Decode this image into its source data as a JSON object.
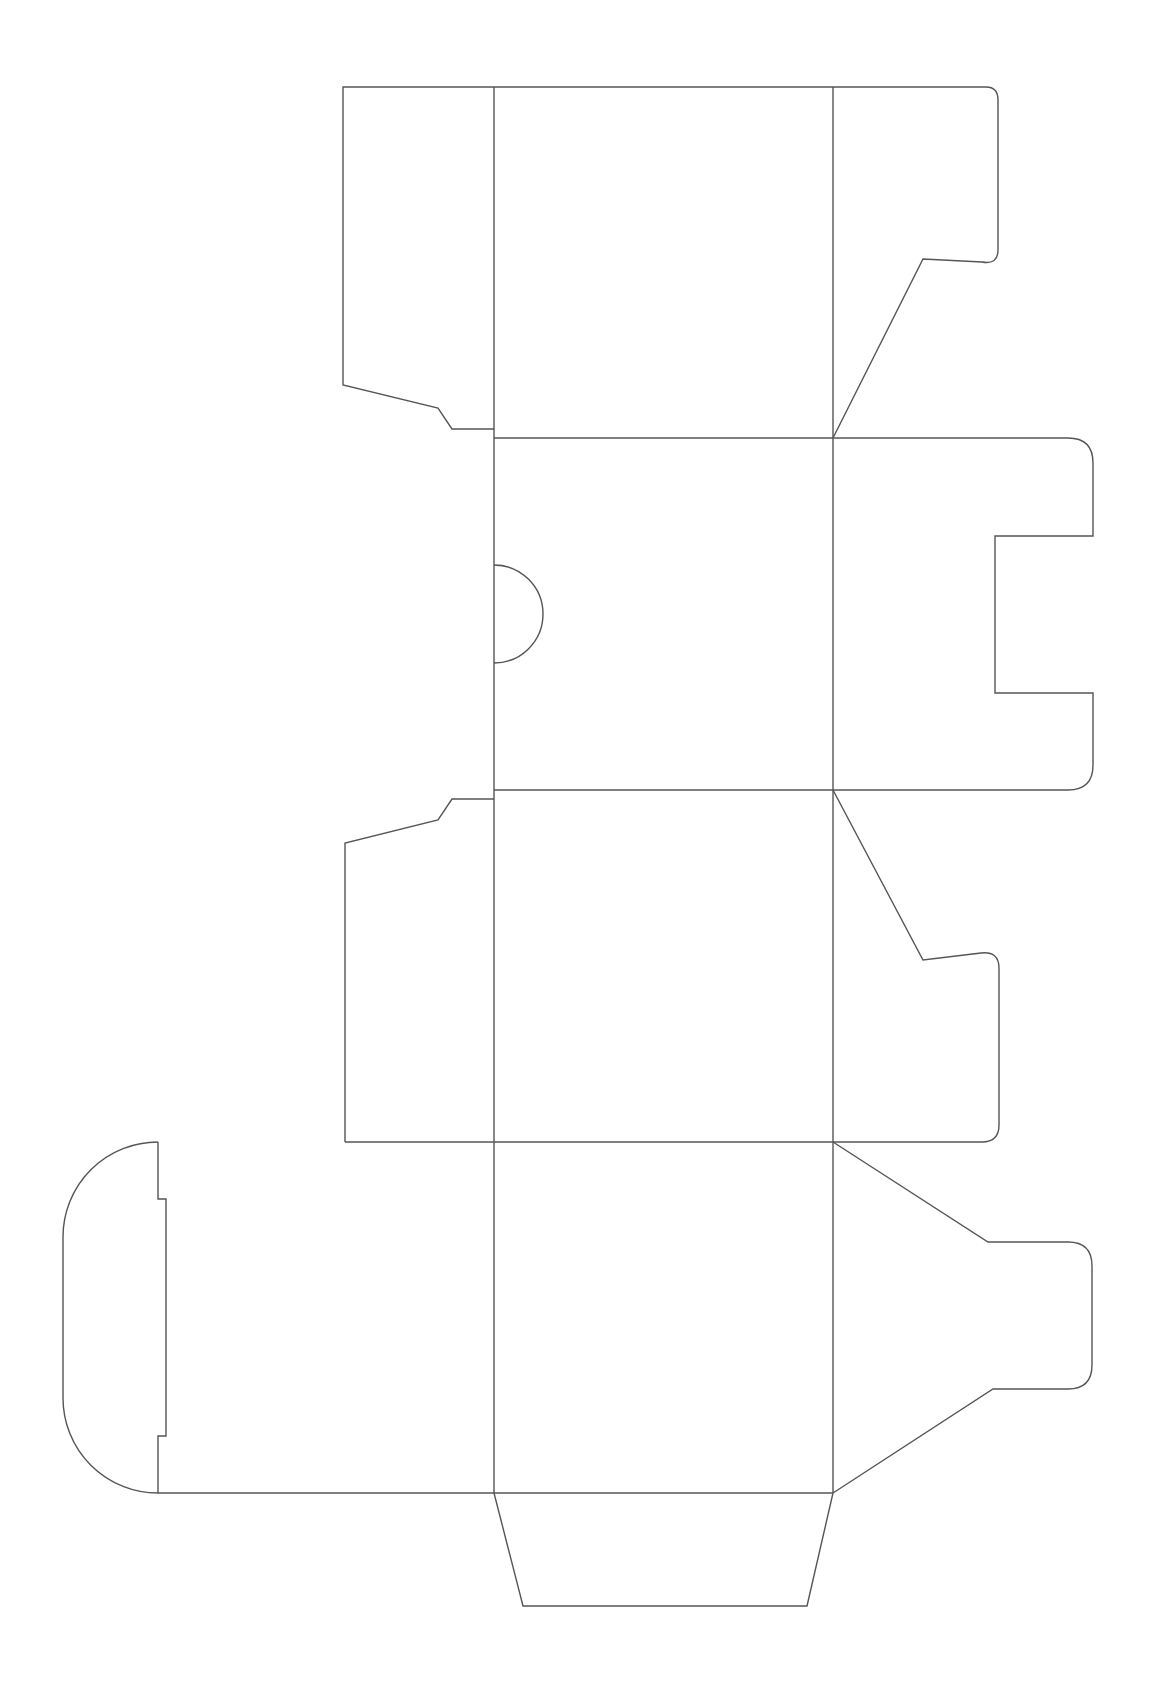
{
  "diagram": {
    "type": "box-dieline",
    "stroke_color": "#555555",
    "background": "#ffffff",
    "title": "",
    "panels": [
      {
        "name": "panel-1",
        "bounds": [
          494,
          87,
          833,
          438
        ]
      },
      {
        "name": "panel-2",
        "bounds": [
          494,
          438,
          833,
          790
        ]
      },
      {
        "name": "panel-3",
        "bounds": [
          494,
          790,
          833,
          1142
        ]
      },
      {
        "name": "panel-4",
        "bounds": [
          494,
          1142,
          833,
          1493
        ]
      }
    ],
    "flaps": [
      "top-left-side-flap",
      "top-right-tuck-flap",
      "glue-flap-with-thumb-notch",
      "right-slotted-flap",
      "lower-left-side-flap",
      "lower-right-tuck-flap",
      "bottom-left-rounded-lid",
      "bottom-right-tab",
      "bottom-trapezoid-flap"
    ]
  }
}
